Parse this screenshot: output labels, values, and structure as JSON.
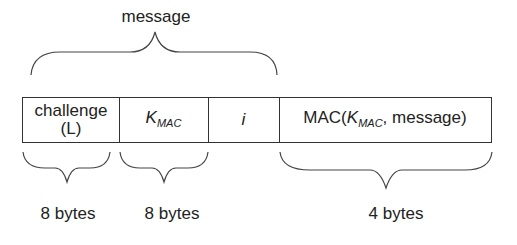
{
  "top_label": "message",
  "fields": [
    {
      "line1": "challenge",
      "line2": "(L)"
    },
    {
      "main": "K",
      "sub": "MAC"
    },
    {
      "main": "i"
    },
    {
      "prefix": "MAC(",
      "main": "K",
      "sub": "MAC",
      "suffix": ", message)"
    }
  ],
  "size_labels": [
    "8 bytes",
    "8 bytes",
    "4 bytes"
  ]
}
